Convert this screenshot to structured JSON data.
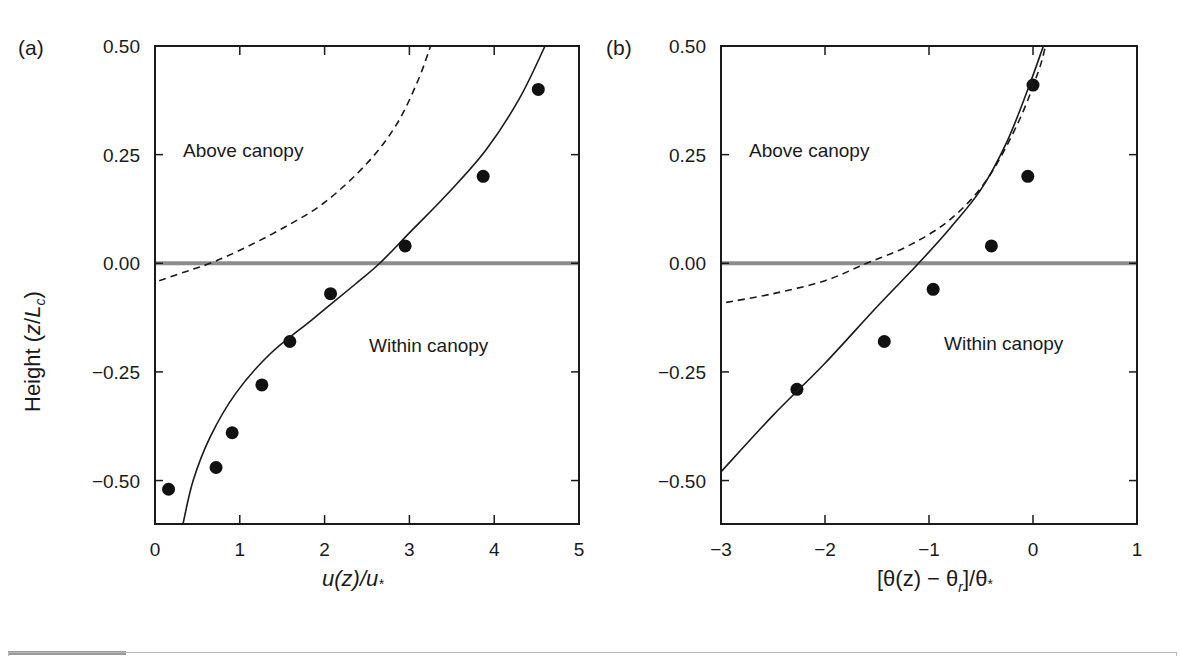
{
  "chart_data": [
    {
      "type": "scatter",
      "panel_label": "(a)",
      "title": "",
      "xlabel": "u(z)/u*",
      "ylabel": "Height (z/Lc)",
      "xlim": [
        0,
        5
      ],
      "ylim": [
        -0.6,
        0.5
      ],
      "xticks": [
        "0",
        "1",
        "2",
        "3",
        "4",
        "5"
      ],
      "yticks": [
        "0.50",
        "0.25",
        "0.00",
        "−0.25",
        "−0.50"
      ],
      "grid": false,
      "annotations": [
        "Above canopy",
        "Within canopy"
      ],
      "reference_line": {
        "y": 0.0,
        "color": "#8c8c8c",
        "label": "canopy top"
      },
      "series": [
        {
          "name": "observations",
          "style": "filled-circle",
          "x": [
            0.16,
            0.72,
            0.91,
            1.26,
            1.59,
            2.07,
            2.95,
            3.87,
            4.52
          ],
          "y": [
            -0.52,
            -0.47,
            -0.39,
            -0.28,
            -0.18,
            -0.07,
            0.04,
            0.2,
            0.4
          ]
        },
        {
          "name": "model (solid)",
          "style": "solid-line",
          "x": [
            0.33,
            0.45,
            0.65,
            0.95,
            1.35,
            1.85,
            2.35,
            2.65,
            3.0,
            3.45,
            3.9,
            4.3,
            4.6
          ],
          "y": [
            -0.6,
            -0.5,
            -0.4,
            -0.3,
            -0.21,
            -0.13,
            -0.05,
            0.0,
            0.07,
            0.16,
            0.26,
            0.38,
            0.5
          ]
        },
        {
          "name": "surface-layer theory (dashed)",
          "style": "dashed-line",
          "x": [
            0.05,
            0.35,
            0.65,
            1.0,
            1.5,
            2.0,
            2.5,
            2.85,
            3.1,
            3.25
          ],
          "y": [
            -0.04,
            -0.02,
            0.0,
            0.03,
            0.08,
            0.14,
            0.23,
            0.32,
            0.42,
            0.5
          ]
        }
      ]
    },
    {
      "type": "scatter",
      "panel_label": "(b)",
      "title": "",
      "xlabel": "[θ(z) − θr]/θ*",
      "ylabel": "",
      "xlim": [
        -3,
        1
      ],
      "ylim": [
        -0.6,
        0.5
      ],
      "xticks": [
        "−3",
        "−2",
        "−1",
        "0",
        "1"
      ],
      "yticks": [
        "0.50",
        "0.25",
        "0.00",
        "−0.25",
        "−0.50"
      ],
      "grid": false,
      "annotations": [
        "Above canopy",
        "Within canopy"
      ],
      "reference_line": {
        "y": 0.0,
        "color": "#8c8c8c",
        "label": "canopy top"
      },
      "series": [
        {
          "name": "observations",
          "style": "filled-circle",
          "x": [
            -2.27,
            -1.43,
            -0.96,
            -0.4,
            -0.05,
            0.0
          ],
          "y": [
            -0.29,
            -0.18,
            -0.06,
            0.04,
            0.2,
            0.41
          ]
        },
        {
          "name": "model (solid)",
          "style": "solid-line",
          "x": [
            -3.0,
            -2.5,
            -2.0,
            -1.5,
            -1.1,
            -0.8,
            -0.5,
            -0.25,
            -0.05,
            0.1
          ],
          "y": [
            -0.48,
            -0.35,
            -0.23,
            -0.1,
            0.0,
            0.08,
            0.17,
            0.28,
            0.4,
            0.5
          ]
        },
        {
          "name": "surface-layer theory (dashed)",
          "style": "dashed-line",
          "x": [
            -2.95,
            -2.5,
            -2.0,
            -1.6,
            -1.2,
            -0.8,
            -0.45,
            -0.15,
            0.05,
            0.12
          ],
          "y": [
            -0.09,
            -0.07,
            -0.04,
            0.0,
            0.04,
            0.1,
            0.19,
            0.32,
            0.44,
            0.5
          ]
        }
      ]
    }
  ],
  "labels": {
    "panel_a": "(a)",
    "panel_b": "(b)",
    "above_canopy": "Above canopy",
    "within_canopy": "Within canopy",
    "ylabel_prefix": "Height (",
    "ylabel_z": "z",
    "ylabel_slash": "/",
    "ylabel_L": "L",
    "ylabel_sub": "c",
    "ylabel_suffix": ")",
    "xlabel_a": "u(z)/u",
    "xlabel_a_sub": "*",
    "xlabel_b_1": "[θ(z) − θ",
    "xlabel_b_sub": "r",
    "xlabel_b_2": "]/θ",
    "xlabel_b_sub2": "*"
  },
  "colors": {
    "ink": "#1a1a1a",
    "canopy_line": "#8c8c8c",
    "footer": "#9a9a9a"
  }
}
